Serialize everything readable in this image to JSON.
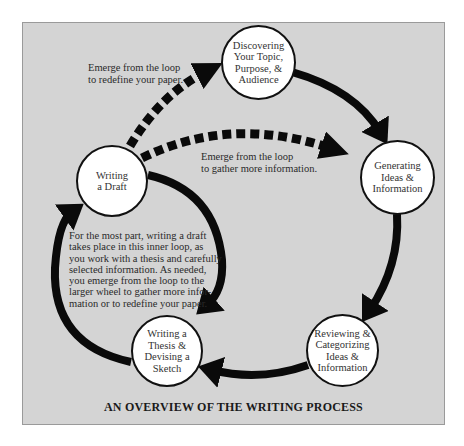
{
  "diagram": {
    "title": "AN OVERVIEW OF THE WRITING PROCESS",
    "nodes": [
      {
        "id": "discovering",
        "label": "Discovering\nYour Topic,\nPurpose, &\nAudience"
      },
      {
        "id": "generating",
        "label": "Generating\nIdeas &\nInformation"
      },
      {
        "id": "reviewing",
        "label": "Reviewing &\nCategorizing\nIdeas &\nInformation"
      },
      {
        "id": "thesis",
        "label": "Writing a\nThesis &\nDevising a\nSketch"
      },
      {
        "id": "draft",
        "label": "Writing\na Draft"
      }
    ],
    "annotations": {
      "redefine": "Emerge from the loop\nto redefine your paper.",
      "gather": "Emerge from the loop\nto gather more information.",
      "inner_loop": "For the most part, writing a draft\ntakes place in this inner loop, as\nyou work with a thesis and carefully\nselected information. As needed,\nyou emerge from the loop to the\nlarger wheel to gather more infor-\nmation or to redefine your paper."
    },
    "edges": [
      {
        "from": "discovering",
        "to": "generating",
        "style": "solid"
      },
      {
        "from": "generating",
        "to": "reviewing",
        "style": "solid"
      },
      {
        "from": "reviewing",
        "to": "thesis",
        "style": "solid"
      },
      {
        "from": "thesis",
        "to": "draft",
        "style": "solid"
      },
      {
        "from": "draft",
        "to": "thesis",
        "style": "solid"
      },
      {
        "from": "draft",
        "to": "discovering",
        "style": "dashed"
      },
      {
        "from": "draft",
        "to": "generating",
        "style": "dashed"
      }
    ],
    "colors": {
      "panel": "#d4d4d4",
      "arrow": "#0a0a0a",
      "node_fill": "#ffffff"
    }
  }
}
